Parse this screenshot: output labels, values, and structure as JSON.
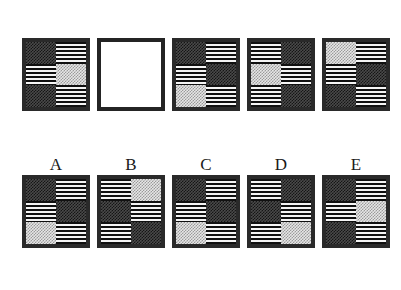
{
  "puzzle": {
    "type": "matrix-reasoning-analogy",
    "texture_legend": {
      "darkcheck": "dark checkerboard",
      "lightcheck": "light checkerboard",
      "stripes": "horizontal stripes"
    },
    "colors": {
      "border": "#2a2a2a",
      "dark_check_fill": "#151515",
      "dark_check_bg": "#4a4a4a",
      "light_check_fill": "#9a9a9a",
      "light_check_bg": "#e6e6e6",
      "stripe_dark": "#101010",
      "stripe_light": "#f4f4f4",
      "page_background": "#ffffff",
      "label_color": "#1a1a1a"
    },
    "grid": {
      "columns": 2,
      "rows": 3
    }
  },
  "problem_row": {
    "label": "",
    "items": [
      {
        "label": "",
        "name": "problem-tile-1",
        "empty": false,
        "cells": [
          "darkcheck",
          "stripes",
          "stripes",
          "lightcheck",
          "darkcheck",
          "stripes"
        ]
      },
      {
        "label": "",
        "name": "problem-tile-blank",
        "empty": true,
        "cells": []
      },
      {
        "label": "",
        "name": "problem-tile-3",
        "empty": false,
        "cells": [
          "darkcheck",
          "stripes",
          "stripes",
          "darkcheck",
          "lightcheck",
          "stripes"
        ]
      },
      {
        "label": "",
        "name": "problem-tile-4",
        "empty": false,
        "cells": [
          "stripes",
          "darkcheck",
          "lightcheck",
          "stripes",
          "stripes",
          "darkcheck"
        ]
      },
      {
        "label": "",
        "name": "problem-tile-5",
        "empty": false,
        "cells": [
          "lightcheck",
          "stripes",
          "stripes",
          "darkcheck",
          "darkcheck",
          "stripes"
        ]
      }
    ]
  },
  "answer_row": {
    "items": [
      {
        "label": "A",
        "name": "answer-option-a",
        "empty": false,
        "cells": [
          "darkcheck",
          "stripes",
          "stripes",
          "darkcheck",
          "lightcheck",
          "stripes"
        ]
      },
      {
        "label": "B",
        "name": "answer-option-b",
        "empty": false,
        "cells": [
          "stripes",
          "lightcheck",
          "darkcheck",
          "stripes",
          "stripes",
          "darkcheck"
        ]
      },
      {
        "label": "C",
        "name": "answer-option-c",
        "empty": false,
        "cells": [
          "darkcheck",
          "stripes",
          "stripes",
          "darkcheck",
          "lightcheck",
          "stripes"
        ]
      },
      {
        "label": "D",
        "name": "answer-option-d",
        "empty": false,
        "cells": [
          "stripes",
          "darkcheck",
          "darkcheck",
          "stripes",
          "stripes",
          "lightcheck"
        ]
      },
      {
        "label": "E",
        "name": "answer-option-e",
        "empty": false,
        "cells": [
          "darkcheck",
          "stripes",
          "stripes",
          "lightcheck",
          "darkcheck",
          "stripes"
        ]
      }
    ]
  }
}
